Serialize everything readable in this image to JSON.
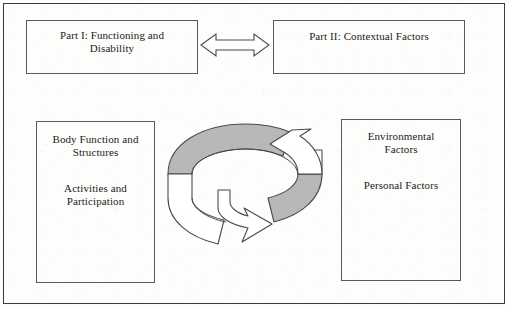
{
  "diagram": {
    "title_semantic": "icf-model-diagram",
    "colors": {
      "frame": "#3a3a3a",
      "box_border": "#5a5a5a",
      "ribbon_shade": "#b8b8b8",
      "ribbon_outline": "#4a4a4a",
      "text": "#1b1b1b",
      "background": "#fdfdfc"
    },
    "boxes": {
      "part1": {
        "name": "part-i-box",
        "lines": [
          "Part I: Functioning and",
          "Disability"
        ]
      },
      "part2": {
        "name": "part-ii-box",
        "lines": [
          "Part II: Contextual Factors"
        ]
      },
      "functioning": {
        "name": "functioning-components-box",
        "group_a": [
          "Body Function and",
          "Structures"
        ],
        "group_b": [
          "Activities and",
          "Participation"
        ]
      },
      "contextual": {
        "name": "contextual-components-box",
        "group_a": [
          "Environmental",
          "Factors"
        ],
        "group_b": [
          "Personal Factors"
        ]
      }
    },
    "connectors": {
      "double_arrow": {
        "name": "double-headed-arrow-icon",
        "direction": "bidirectional-horizontal"
      },
      "cycle_arrow": {
        "name": "circular-cycle-arrow-icon",
        "description": "3D elliptical ribbon with two opposing arrowheads indicating mutual interaction"
      }
    }
  }
}
